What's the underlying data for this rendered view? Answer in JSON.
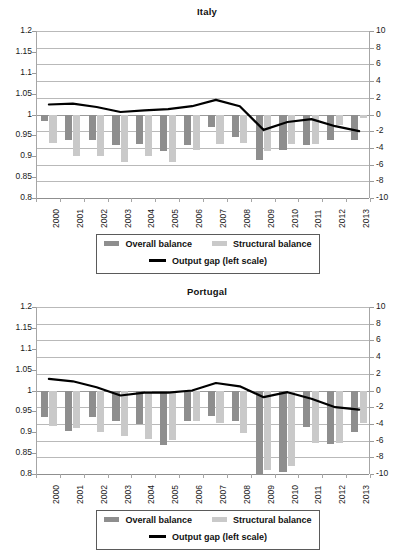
{
  "chart_data": [
    {
      "type": "bar",
      "title": "Italy",
      "xlabel": "",
      "ylabel": "",
      "categories": [
        "2000",
        "2001",
        "2002",
        "2003",
        "2004",
        "2005",
        "2006",
        "2007",
        "2008",
        "2009",
        "2010",
        "2011",
        "2012",
        "2013"
      ],
      "left_axis": {
        "ticks": [
          "1.2",
          "1.15",
          "1.1",
          "1.05",
          "1",
          "0.95",
          "0.9",
          "0.85",
          "0.8"
        ],
        "min": 0.8,
        "max": 1.2
      },
      "right_axis": {
        "ticks": [
          "10",
          "8",
          "6",
          "4",
          "2",
          "0",
          "-2",
          "-4",
          "-6",
          "-8",
          "-10"
        ],
        "min": -10,
        "max": 10
      },
      "grid": true,
      "legend_position": "bottom",
      "series": [
        {
          "name": "Overall balance",
          "type": "bar",
          "color": "#8e8e8e",
          "axis": "right",
          "values": [
            -0.8,
            -3.1,
            -3.1,
            -3.6,
            -3.5,
            -4.4,
            -3.6,
            -1.5,
            -2.7,
            -5.4,
            -4.2,
            -3.7,
            -3.0,
            -3.0
          ]
        },
        {
          "name": "Structural balance",
          "type": "bar",
          "color": "#c9c9c9",
          "axis": "right",
          "values": [
            -3.4,
            -5.0,
            -5.0,
            -5.7,
            -5.0,
            -5.7,
            -4.3,
            -3.5,
            -3.4,
            -4.4,
            -3.5,
            -3.5,
            -1.3,
            -0.4
          ]
        },
        {
          "name": "Output gap (left scale)",
          "type": "line",
          "color": "#000000",
          "axis": "right",
          "values": [
            1.2,
            1.3,
            0.9,
            0.3,
            0.5,
            0.65,
            1.0,
            1.75,
            1.0,
            -1.85,
            -0.9,
            -0.55,
            -1.4,
            -2.0
          ]
        }
      ],
      "legend": [
        {
          "label": "Overall balance",
          "swatch": "overall"
        },
        {
          "label": "Structural balance",
          "swatch": "structural"
        },
        {
          "label": "Output gap (left scale)",
          "swatch": "line"
        }
      ]
    },
    {
      "type": "bar",
      "title": "Portugal",
      "xlabel": "",
      "ylabel": "",
      "categories": [
        "2000",
        "2001",
        "2002",
        "2003",
        "2004",
        "2005",
        "2006",
        "2007",
        "2008",
        "2009",
        "2010",
        "2011",
        "2012",
        "2013"
      ],
      "left_axis": {
        "ticks": [
          "1.2",
          "1.15",
          "1.1",
          "1.05",
          "1",
          "0.95",
          "0.9",
          "0.85",
          "0.8"
        ],
        "min": 0.8,
        "max": 1.2
      },
      "right_axis": {
        "ticks": [
          "10",
          "8",
          "6",
          "4",
          "2",
          "0",
          "-2",
          "-4",
          "-6",
          "-8",
          "-10"
        ],
        "min": -10,
        "max": 10
      },
      "grid": true,
      "legend_position": "bottom",
      "series": [
        {
          "name": "Overall balance",
          "type": "bar",
          "color": "#8e8e8e",
          "axis": "right",
          "values": [
            -3.2,
            -4.8,
            -3.2,
            -3.7,
            -4.0,
            -6.5,
            -3.6,
            -3.1,
            -3.6,
            -10.2,
            -9.8,
            -4.4,
            -6.4,
            -5.0
          ]
        },
        {
          "name": "Structural balance",
          "type": "bar",
          "color": "#c9c9c9",
          "axis": "right",
          "values": [
            -4.2,
            -4.5,
            -5.0,
            -5.5,
            -5.8,
            -5.9,
            -3.6,
            -3.9,
            -5.1,
            -9.5,
            -9.0,
            -6.3,
            -6.3,
            -3.9
          ]
        },
        {
          "name": "Output gap (left scale)",
          "type": "line",
          "color": "#000000",
          "axis": "right",
          "values": [
            1.4,
            1.1,
            0.4,
            -0.6,
            -0.25,
            -0.25,
            0.0,
            0.9,
            0.5,
            -0.8,
            -0.2,
            -1.0,
            -2.0,
            -2.3
          ]
        }
      ],
      "legend": [
        {
          "label": "Overall balance",
          "swatch": "overall"
        },
        {
          "label": "Structural balance",
          "swatch": "structural"
        },
        {
          "label": "Output gap (left scale)",
          "swatch": "line"
        }
      ]
    }
  ]
}
